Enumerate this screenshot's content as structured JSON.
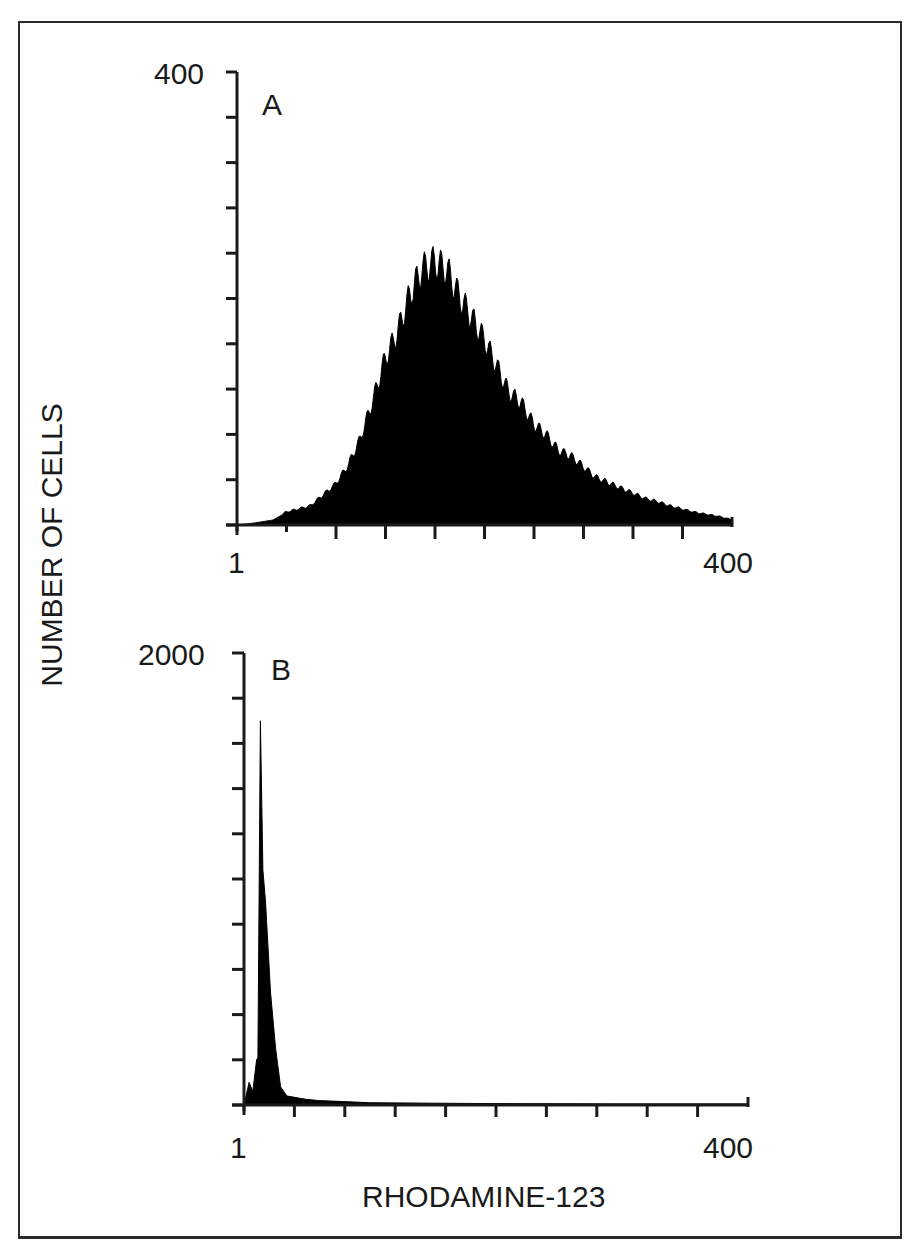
{
  "figure": {
    "y_axis_label": "NUMBER OF CELLS",
    "x_axis_label": "RHODAMINE-123"
  },
  "panels": [
    {
      "letter": "A",
      "y_max_label": "400",
      "x_min_label": "1",
      "x_max_label": "400"
    },
    {
      "letter": "B",
      "y_max_label": "2000",
      "x_min_label": "1",
      "x_max_label": "400"
    }
  ],
  "chart_data": [
    {
      "type": "area",
      "title": "A",
      "xlabel": "RHODAMINE-123",
      "ylabel": "NUMBER OF CELLS",
      "xlim": [
        1,
        400
      ],
      "ylim": [
        0,
        400
      ],
      "x_tick_labels": [
        "1",
        "400"
      ],
      "y_tick_labels": [
        "400"
      ],
      "x_ticks_count": 11,
      "y_ticks_count": 11,
      "grid": false,
      "legend": null,
      "fill_color": "#000000",
      "channels": [
        1,
        15,
        30,
        40,
        50,
        60,
        70,
        80,
        90,
        100,
        110,
        120,
        130,
        140,
        150,
        160,
        170,
        180,
        190,
        200,
        210,
        220,
        230,
        240,
        250,
        260,
        270,
        280,
        290,
        300,
        310,
        320,
        330,
        340,
        350,
        360,
        370,
        380,
        390,
        400
      ],
      "values": [
        0,
        2,
        5,
        12,
        15,
        18,
        28,
        38,
        55,
        80,
        115,
        155,
        180,
        215,
        240,
        247,
        240,
        215,
        195,
        175,
        150,
        125,
        115,
        95,
        85,
        70,
        65,
        55,
        45,
        40,
        35,
        30,
        25,
        22,
        18,
        15,
        12,
        10,
        8,
        5
      ]
    },
    {
      "type": "area",
      "title": "B",
      "xlabel": "RHODAMINE-123",
      "ylabel": "NUMBER OF CELLS",
      "xlim": [
        1,
        400
      ],
      "ylim": [
        0,
        2000
      ],
      "x_tick_labels": [
        "1",
        "400"
      ],
      "y_tick_labels": [
        "2000"
      ],
      "x_ticks_count": 11,
      "y_ticks_count": 11,
      "grid": false,
      "legend": null,
      "fill_color": "#000000",
      "channels": [
        1,
        5,
        8,
        11,
        12,
        14,
        16,
        18,
        20,
        22,
        26,
        30,
        35,
        40,
        45,
        50,
        60,
        80,
        100,
        150,
        200,
        300,
        400
      ],
      "values": [
        0,
        100,
        60,
        200,
        210,
        1700,
        1040,
        900,
        700,
        500,
        250,
        80,
        40,
        35,
        30,
        25,
        20,
        15,
        10,
        8,
        6,
        5,
        5
      ]
    }
  ]
}
